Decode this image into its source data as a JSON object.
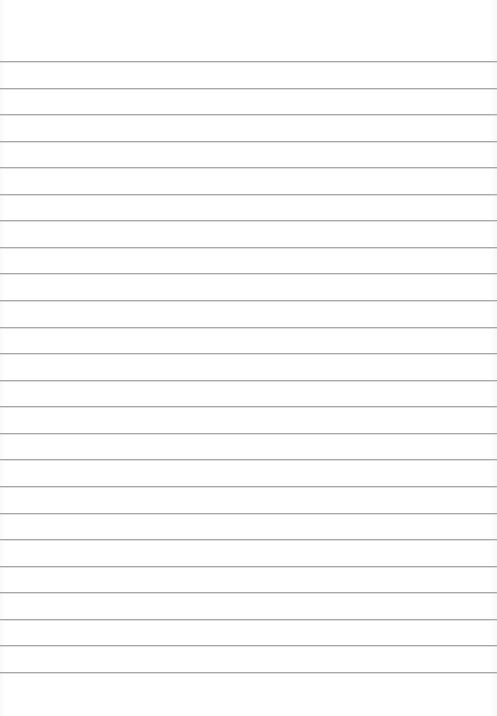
{
  "paper": {
    "type": "lined-paper",
    "background_color": "#ffffff",
    "line_color": "#a9a9a9",
    "line_count": 24,
    "first_line_y": 61,
    "line_spacing": 26.56
  }
}
